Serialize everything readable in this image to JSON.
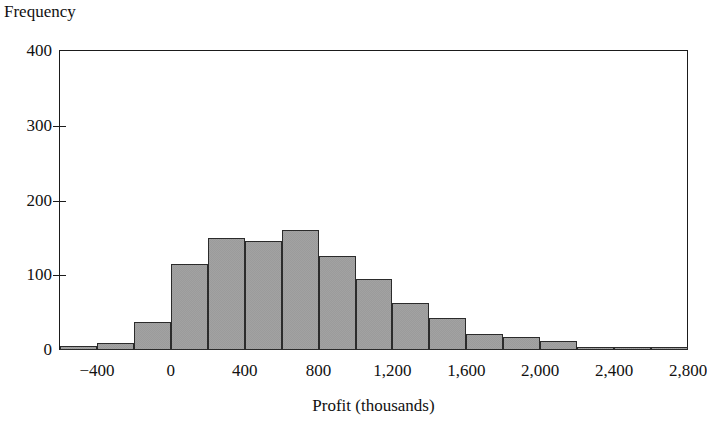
{
  "chart_data": {
    "type": "bar",
    "title": "",
    "xlabel": "Profit (thousands)",
    "ylabel": "Frequency",
    "grid": false,
    "legend": null,
    "xlim": [
      -600,
      2800
    ],
    "ylim": [
      0,
      400
    ],
    "bin_width": 200,
    "x_tick_labels": [
      "−400",
      "0",
      "400",
      "800",
      "1,200",
      "1,600",
      "2,000",
      "2,400",
      "2,800"
    ],
    "x_tick_values": [
      -400,
      0,
      400,
      800,
      1200,
      1600,
      2000,
      2400,
      2800
    ],
    "y_tick_labels": [
      "0",
      "100",
      "200",
      "300",
      "400"
    ],
    "y_tick_values": [
      0,
      100,
      200,
      300,
      400
    ],
    "bin_edges": [
      -600,
      -400,
      -200,
      0,
      200,
      400,
      600,
      800,
      1000,
      1200,
      1400,
      1600,
      1800,
      2000,
      2200,
      2400,
      2600,
      2800
    ],
    "categories": [
      "-600",
      "-400",
      "-200",
      "0",
      "200",
      "400",
      "600",
      "800",
      "1000",
      "1200",
      "1400",
      "1600",
      "1800",
      "2000",
      "2200",
      "2400",
      "2600"
    ],
    "values": [
      5,
      10,
      38,
      115,
      150,
      146,
      160,
      126,
      95,
      63,
      43,
      22,
      18,
      12,
      2,
      2,
      3
    ],
    "bar_fill_color": "#9b9b9b",
    "bar_edge_color": "#2b2b2b",
    "axis_color": "#1b1b1b",
    "background_color": "#ffffff"
  },
  "axes": {
    "y_title": "Frequency",
    "x_title": "Profit (thousands)"
  }
}
